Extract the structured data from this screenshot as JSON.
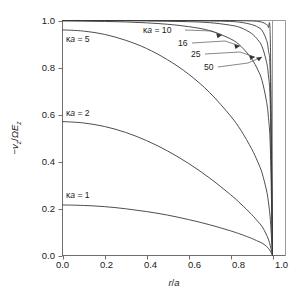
{
  "chart_data": {
    "type": "line",
    "title": "",
    "subtitle": "",
    "xlabel": "r/a",
    "ylabel": "−v_z/ΩE_z",
    "xlim": [
      0.0,
      1.0
    ],
    "ylim": [
      0.0,
      1.0
    ],
    "grid": false,
    "legend_position": "inline-annotations",
    "xticks": [
      "0.0",
      "0.2",
      "0.4",
      "0.6",
      "0.8",
      "1.0"
    ],
    "xtick_values": [
      0.0,
      0.2,
      0.4,
      0.6,
      0.8,
      1.0
    ],
    "yticks": [
      "0.0",
      "0.2",
      "0.4",
      "0.6",
      "0.8",
      "1.0"
    ],
    "ytick_values": [
      0.0,
      0.2,
      0.4,
      0.6,
      0.8,
      1.0
    ],
    "x": [
      0.0,
      0.1,
      0.2,
      0.3,
      0.4,
      0.5,
      0.6,
      0.7,
      0.8,
      0.85,
      0.9,
      0.93,
      0.95,
      0.97,
      0.98,
      0.99,
      1.0
    ],
    "series": [
      {
        "name": "κa = 1",
        "label": "κa = 1",
        "kappa_a": 1,
        "values": [
          0.215,
          0.213,
          0.208,
          0.199,
          0.187,
          0.172,
          0.153,
          0.131,
          0.105,
          0.09,
          0.073,
          0.061,
          0.053,
          0.04,
          0.031,
          0.018,
          0.0
        ]
      },
      {
        "name": "κa = 2",
        "label": "κa = 2",
        "kappa_a": 2,
        "values": [
          0.57,
          0.564,
          0.549,
          0.524,
          0.489,
          0.445,
          0.392,
          0.33,
          0.259,
          0.219,
          0.175,
          0.145,
          0.124,
          0.091,
          0.07,
          0.04,
          0.0
        ]
      },
      {
        "name": "κa = 5",
        "label": "κa = 5",
        "kappa_a": 5,
        "values": [
          0.96,
          0.955,
          0.941,
          0.916,
          0.881,
          0.833,
          0.772,
          0.694,
          0.594,
          0.532,
          0.455,
          0.398,
          0.352,
          0.283,
          0.232,
          0.15,
          0.0
        ]
      },
      {
        "name": "κa = 10",
        "label": "κa = 10",
        "kappa_a": 10,
        "values": [
          0.998,
          0.997,
          0.996,
          0.994,
          0.99,
          0.984,
          0.974,
          0.957,
          0.922,
          0.89,
          0.838,
          0.79,
          0.745,
          0.663,
          0.594,
          0.45,
          0.0
        ]
      },
      {
        "name": "16",
        "label": "16",
        "kappa_a": 16,
        "values": [
          1.0,
          1.0,
          0.999,
          0.999,
          0.998,
          0.997,
          0.995,
          0.991,
          0.98,
          0.969,
          0.945,
          0.918,
          0.89,
          0.829,
          0.77,
          0.62,
          0.0
        ]
      },
      {
        "name": "25",
        "label": "25",
        "kappa_a": 25,
        "values": [
          1.0,
          1.0,
          1.0,
          1.0,
          1.0,
          0.999,
          0.999,
          0.998,
          0.996,
          0.992,
          0.983,
          0.972,
          0.958,
          0.92,
          0.876,
          0.74,
          0.0
        ]
      },
      {
        "name": "50",
        "label": "50",
        "kappa_a": 50,
        "values": [
          1.0,
          1.0,
          1.0,
          1.0,
          1.0,
          1.0,
          1.0,
          1.0,
          1.0,
          0.999,
          0.998,
          0.996,
          0.993,
          0.984,
          0.971,
          0.9,
          0.0
        ]
      }
    ],
    "annotations": [
      {
        "text": "κa = 5",
        "target_series": "κa = 5"
      },
      {
        "text": "κa = 2",
        "target_series": "κa = 2"
      },
      {
        "text": "κa = 1",
        "target_series": "κa = 1"
      },
      {
        "text": "κa = 10",
        "target_series": "κa = 10",
        "leader": true
      },
      {
        "text": "16",
        "target_series": "16",
        "leader": true
      },
      {
        "text": "25",
        "target_series": "25",
        "leader": true
      },
      {
        "text": "50",
        "target_series": "50",
        "leader": true
      }
    ]
  },
  "axes": {
    "x_label_main": "r",
    "x_label_slash": "/",
    "x_label_denom": "a",
    "y_label_minus": "−",
    "y_label_v": "v",
    "y_label_v_sub": "z",
    "y_label_slash": "/",
    "y_label_omega": "Ω",
    "y_label_E": "E",
    "y_label_E_sub": "z",
    "xtick_0": "0.0",
    "xtick_1": "0.2",
    "xtick_2": "0.4",
    "xtick_3": "0.6",
    "xtick_4": "0.8",
    "xtick_5": "1.0",
    "ytick_0": "0.0",
    "ytick_1": "0.2",
    "ytick_2": "0.4",
    "ytick_3": "0.6",
    "ytick_4": "0.8",
    "ytick_5": "1.0"
  },
  "labels": {
    "ka5_kappa": "κ",
    "ka5_a": "a",
    "ka5_eq": " = 5",
    "ka2_kappa": "κ",
    "ka2_a": "a",
    "ka2_eq": " = 2",
    "ka1_kappa": "κ",
    "ka1_a": "a",
    "ka1_eq": " = 1",
    "ka10_kappa": "κ",
    "ka10_a": "a",
    "ka10_eq": " = 10",
    "n16": "16",
    "n25": "25",
    "n50": "50"
  },
  "style": {
    "background": "#ffffff",
    "curve_color": "#3a3a3a",
    "axis_color": "#6e6e6e",
    "frame_color": "#9a9a9a",
    "text_color": "#1a1a1a"
  }
}
